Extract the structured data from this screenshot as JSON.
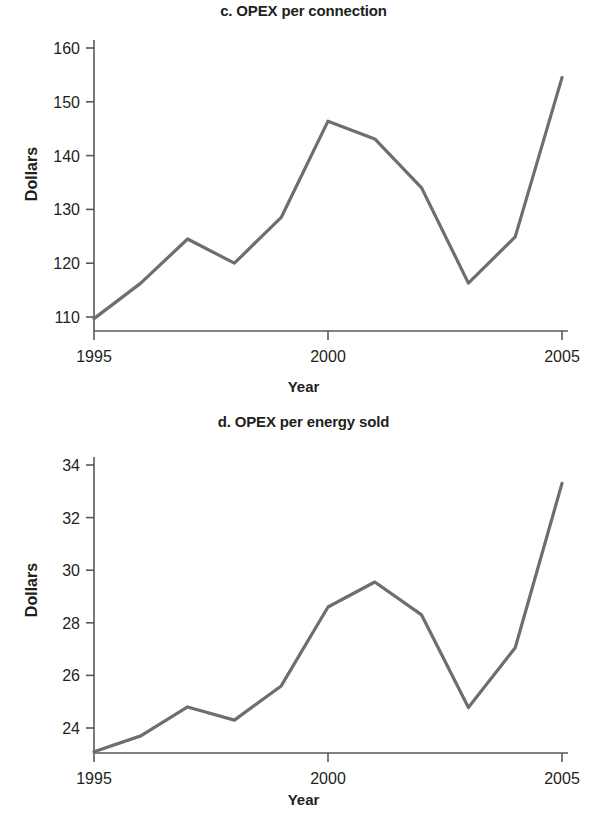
{
  "figure": {
    "background": "#ffffff",
    "line_color": "#6d6e70",
    "axis_color": "#58595b",
    "text_color": "#231f20"
  },
  "panels": [
    {
      "id": "c",
      "title": "c. OPEX per connection",
      "xlabel": "Year",
      "ylabel": "Dollars",
      "yticks": [
        "110",
        "120",
        "130",
        "140",
        "150",
        "160"
      ],
      "xticks": [
        "1995",
        "2000",
        "2005"
      ]
    },
    {
      "id": "d",
      "title": "d. OPEX per energy sold",
      "xlabel": "Year",
      "ylabel": "Dollars",
      "yticks": [
        "24",
        "26",
        "28",
        "30",
        "32",
        "34"
      ],
      "xticks": [
        "1995",
        "2000",
        "2005"
      ]
    }
  ],
  "chart_data": [
    {
      "type": "line",
      "title": "c. OPEX per connection",
      "xlabel": "Year",
      "ylabel": "Dollars",
      "x": [
        1995,
        1996,
        1997,
        1998,
        1999,
        2000,
        2001,
        2002,
        2003,
        2004,
        2005
      ],
      "values": [
        109.7,
        116.3,
        124.5,
        120.0,
        128.5,
        146.4,
        143.1,
        134.0,
        116.3,
        124.9,
        154.5
      ],
      "xlim": [
        1995,
        2005
      ],
      "ylim": [
        108.3,
        161.5
      ],
      "ytick_values": [
        110,
        120,
        130,
        140,
        150,
        160
      ],
      "xtick_values": [
        1995,
        2000,
        2005
      ],
      "grid": false,
      "legend": false,
      "series_color": "#6d6e70"
    },
    {
      "type": "line",
      "title": "d. OPEX per energy sold",
      "xlabel": "Year",
      "ylabel": "Dollars",
      "x": [
        1995,
        1996,
        1997,
        1998,
        1999,
        2000,
        2001,
        2002,
        2003,
        2004,
        2005
      ],
      "values": [
        23.1,
        23.7,
        24.8,
        24.3,
        25.6,
        28.6,
        29.55,
        28.3,
        24.78,
        27.05,
        33.3
      ],
      "xlim": [
        1995,
        2005
      ],
      "ylim": [
        22.75,
        34.45
      ],
      "ytick_values": [
        24,
        26,
        28,
        30,
        32,
        34
      ],
      "xtick_values": [
        1995,
        2000,
        2005
      ],
      "grid": false,
      "legend": false,
      "series_color": "#6d6e70"
    }
  ]
}
